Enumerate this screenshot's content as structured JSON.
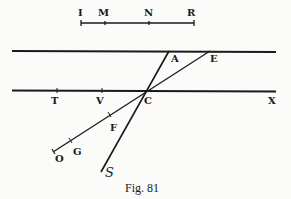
{
  "figure": {
    "caption": "Fig. 81",
    "scale_labels": {
      "I": "I",
      "M": "M",
      "N": "N",
      "R": "R"
    },
    "point_labels": {
      "A": "A",
      "E": "E",
      "T": "T",
      "V": "V",
      "C": "C",
      "X": "X",
      "F": "F",
      "G": "G",
      "O": "O",
      "S": "S"
    },
    "ink_color": "#1a1a1a",
    "paper_color": "#fbfbfa"
  }
}
